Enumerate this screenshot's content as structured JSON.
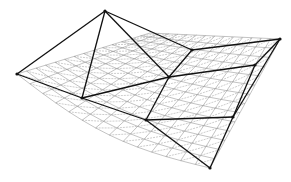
{
  "figure": {
    "background": "#ffffff",
    "coarse_color": "#111111",
    "fine_color": "#9a9a9a",
    "vertices": {
      "T": [
        105,
        11
      ],
      "L": [
        17,
        74
      ],
      "A": [
        82,
        98
      ],
      "D": [
        146,
        120
      ],
      "B": [
        210,
        168
      ],
      "C": [
        169,
        77
      ],
      "U": [
        192,
        50
      ],
      "R": [
        280,
        39
      ],
      "R2": [
        255,
        65
      ],
      "R3": [
        233,
        117
      ]
    },
    "edges": [
      [
        "T",
        "L"
      ],
      [
        "T",
        "A"
      ],
      [
        "T",
        "C"
      ],
      [
        "T",
        "U"
      ],
      [
        "L",
        "A"
      ],
      [
        "A",
        "D"
      ],
      [
        "D",
        "B"
      ],
      [
        "A",
        "C"
      ],
      [
        "C",
        "D"
      ],
      [
        "C",
        "U"
      ],
      [
        "U",
        "R"
      ],
      [
        "C",
        "R2"
      ],
      [
        "R2",
        "R"
      ],
      [
        "D",
        "R3"
      ],
      [
        "R3",
        "R2"
      ],
      [
        "R",
        "R3"
      ],
      [
        "R3",
        "B"
      ]
    ]
  }
}
